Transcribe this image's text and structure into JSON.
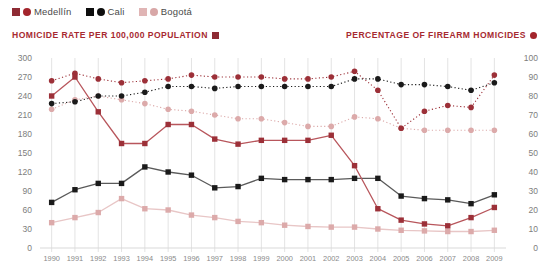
{
  "legend": {
    "items": [
      {
        "label": "Medellín",
        "square": "#8e2b34",
        "circle": "#a3252c"
      },
      {
        "label": "Cali",
        "square": "#0e0e0e",
        "circle": "#0e0e0e"
      },
      {
        "label": "Bogotá",
        "square": "#e0b5b5",
        "circle": "#d8a7a7"
      }
    ]
  },
  "titles": {
    "left": "HOMICIDE RATE PER 100,000 POPULATION",
    "right": "PERCENTAGE OF FIREARM HOMICIDES"
  },
  "colors": {
    "medellin": "#9c3038",
    "medellin_line": "#b8565c",
    "cali": "#1a1a1a",
    "cali_line": "#5a5a5a",
    "bogota": "#dcaaaa",
    "bogota_line": "#e8c6c6",
    "accent": "#a72a31",
    "grid": "#e3e3e3",
    "tick_text": "#8a8a8a"
  },
  "chart_data": {
    "type": "line",
    "xlabel": "",
    "ylabel": "HOMICIDE RATE PER 100,000 POPULATION",
    "y2label": "PERCENTAGE OF FIREARM HOMICIDES",
    "x": [
      1990,
      1991,
      1992,
      1993,
      1994,
      1995,
      1996,
      1997,
      1998,
      1999,
      2000,
      2001,
      2002,
      2003,
      2004,
      2005,
      2006,
      2007,
      2008,
      2009
    ],
    "ylim": [
      0,
      300
    ],
    "yticks": [
      0,
      30,
      60,
      90,
      120,
      150,
      180,
      210,
      240,
      270,
      300
    ],
    "y2lim": [
      0,
      100
    ],
    "y2ticks": [
      0,
      10,
      20,
      30,
      40,
      50,
      60,
      70,
      80,
      90,
      100
    ],
    "grid": true,
    "legend_position": "top-left",
    "series": [
      {
        "name": "Medellín",
        "axis": "left",
        "style": "solid",
        "marker": "square",
        "color": "#9c3038",
        "values": [
          240,
          270,
          215,
          165,
          165,
          195,
          195,
          172,
          164,
          170,
          170,
          170,
          178,
          130,
          62,
          44,
          38,
          35,
          48,
          64
        ]
      },
      {
        "name": "Cali",
        "axis": "left",
        "style": "solid",
        "marker": "square",
        "color": "#1a1a1a",
        "values": [
          72,
          92,
          102,
          102,
          128,
          120,
          115,
          95,
          97,
          110,
          108,
          108,
          108,
          110,
          110,
          82,
          78,
          76,
          70,
          84
        ]
      },
      {
        "name": "Bogotá",
        "axis": "left",
        "style": "solid",
        "marker": "square",
        "color": "#dcaaaa",
        "values": [
          40,
          48,
          56,
          78,
          62,
          60,
          52,
          48,
          42,
          40,
          36,
          34,
          33,
          33,
          30,
          28,
          27,
          26,
          26,
          28
        ]
      },
      {
        "name": "Medellín",
        "axis": "right",
        "style": "dotted",
        "marker": "circle",
        "color": "#9c3038",
        "values": [
          88,
          92,
          89,
          87,
          88,
          89,
          91,
          90,
          90,
          90,
          89,
          89,
          90,
          93,
          83,
          63,
          72,
          75,
          74,
          91
        ]
      },
      {
        "name": "Cali",
        "axis": "right",
        "style": "dotted",
        "marker": "circle",
        "color": "#1a1a1a",
        "values": [
          76,
          77,
          80,
          80,
          82,
          85,
          85,
          84,
          85,
          85,
          85,
          85,
          85,
          89,
          89,
          86,
          86,
          85,
          83,
          87
        ]
      },
      {
        "name": "Bogotá",
        "axis": "right",
        "style": "dotted",
        "marker": "circle",
        "color": "#dcaaaa",
        "values": [
          73,
          78,
          80,
          78,
          76,
          73,
          72,
          70,
          68,
          68,
          66,
          64,
          64,
          69,
          68,
          63,
          62,
          62,
          62,
          62
        ]
      }
    ]
  }
}
